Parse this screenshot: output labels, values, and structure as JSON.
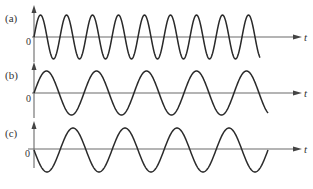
{
  "figure": {
    "caption": "",
    "panels": [
      {
        "id": "a",
        "label": "(a)",
        "origin_label": "0",
        "x_axis_label": "t",
        "axis_y": 37,
        "origin_x": 34,
        "amplitude": 22,
        "period": 26,
        "end_x": 260,
        "phase": "sine",
        "cycles": 8.75
      },
      {
        "id": "b",
        "label": "(b)",
        "origin_label": "0",
        "x_axis_label": "t",
        "axis_y": 93,
        "origin_x": 34,
        "amplitude": 22,
        "period": 50,
        "end_x": 268,
        "phase": "sine",
        "cycles": 4.5
      },
      {
        "id": "c",
        "label": "(c)",
        "origin_label": "0",
        "x_axis_label": "t",
        "axis_y": 150,
        "origin_x": 34,
        "amplitude": 22,
        "period": 52,
        "end_x": 268,
        "phase": "negative-sine",
        "cycles": 4.5
      }
    ]
  },
  "chart_data": [
    {
      "type": "line",
      "title": "(a)",
      "xlabel": "t",
      "ylabel": "",
      "description": "Sine wave starting at 0 going positive, highest frequency (~9 cycles)",
      "relative_frequency": 2,
      "amplitude": 1,
      "phase_deg": 0
    },
    {
      "type": "line",
      "title": "(b)",
      "xlabel": "t",
      "ylabel": "",
      "description": "Sine wave starting at 0 going positive, lower frequency (~4.7 cycles)",
      "relative_frequency": 1,
      "amplitude": 1,
      "phase_deg": 0
    },
    {
      "type": "line",
      "title": "(c)",
      "xlabel": "t",
      "ylabel": "",
      "description": "Sine wave starting at 0 going negative (180° phase shift), same frequency as (b)",
      "relative_frequency": 1,
      "amplitude": 1,
      "phase_deg": 180
    }
  ]
}
